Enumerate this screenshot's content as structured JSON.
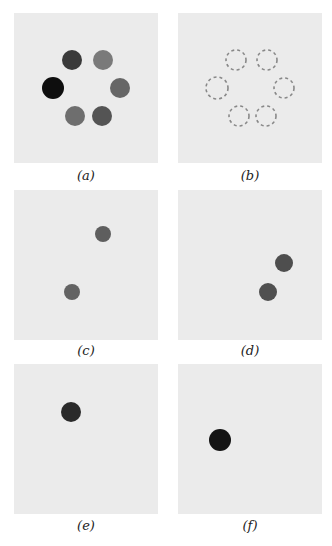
{
  "figure": {
    "panels": [
      {
        "id": "a",
        "label": "(a)",
        "description": "six filled dots arranged in a ring, varying gray intensity",
        "dots": [
          {
            "cx": 58,
            "cy": 47,
            "r": 10,
            "color": "#3a3a3a",
            "style": "filled"
          },
          {
            "cx": 89,
            "cy": 47,
            "r": 10,
            "color": "#7a7a7a",
            "style": "filled"
          },
          {
            "cx": 39,
            "cy": 75,
            "r": 11,
            "color": "#0e0e0e",
            "style": "filled"
          },
          {
            "cx": 106,
            "cy": 75,
            "r": 10,
            "color": "#666666",
            "style": "filled"
          },
          {
            "cx": 61,
            "cy": 103,
            "r": 10,
            "color": "#6e6e6e",
            "style": "filled"
          },
          {
            "cx": 88,
            "cy": 103,
            "r": 10,
            "color": "#545454",
            "style": "filled"
          }
        ]
      },
      {
        "id": "b",
        "label": "(b)",
        "description": "six dashed circle outlines arranged in a ring",
        "dots": [
          {
            "cx": 58,
            "cy": 47,
            "r": 10,
            "color": "#888888",
            "style": "dashed"
          },
          {
            "cx": 89,
            "cy": 47,
            "r": 10,
            "color": "#888888",
            "style": "dashed"
          },
          {
            "cx": 39,
            "cy": 75,
            "r": 11,
            "color": "#888888",
            "style": "dashed"
          },
          {
            "cx": 106,
            "cy": 75,
            "r": 10,
            "color": "#888888",
            "style": "dashed"
          },
          {
            "cx": 61,
            "cy": 103,
            "r": 10,
            "color": "#888888",
            "style": "dashed"
          },
          {
            "cx": 88,
            "cy": 103,
            "r": 10,
            "color": "#888888",
            "style": "dashed"
          }
        ]
      },
      {
        "id": "c",
        "label": "(c)",
        "description": "two medium-gray dots",
        "dots": [
          {
            "cx": 89,
            "cy": 44,
            "r": 8,
            "color": "#5e5e5e",
            "style": "filled"
          },
          {
            "cx": 58,
            "cy": 102,
            "r": 8,
            "color": "#636363",
            "style": "filled"
          }
        ]
      },
      {
        "id": "d",
        "label": "(d)",
        "description": "two dark-gray dots",
        "dots": [
          {
            "cx": 106,
            "cy": 73,
            "r": 9,
            "color": "#4e4e4e",
            "style": "filled"
          },
          {
            "cx": 90,
            "cy": 102,
            "r": 9,
            "color": "#505050",
            "style": "filled"
          }
        ]
      },
      {
        "id": "e",
        "label": "(e)",
        "description": "single dark dot",
        "dots": [
          {
            "cx": 57,
            "cy": 48,
            "r": 10,
            "color": "#2a2a2a",
            "style": "filled"
          }
        ]
      },
      {
        "id": "f",
        "label": "(f)",
        "description": "single near-black dot",
        "dots": [
          {
            "cx": 42,
            "cy": 76,
            "r": 11,
            "color": "#141414",
            "style": "filled"
          }
        ]
      }
    ],
    "panel_background": "#ebebeb"
  }
}
